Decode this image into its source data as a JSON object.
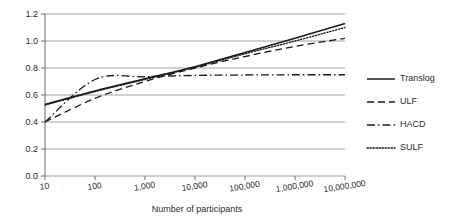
{
  "chart_data": {
    "type": "line",
    "title": "",
    "subtitle": "",
    "xlabel": "Number of participants",
    "ylabel": "",
    "xscale": "log",
    "xlim": [
      10,
      10000000
    ],
    "ylim": [
      0.0,
      1.2
    ],
    "grid": "horizontal",
    "legend_position": "right",
    "xtick_labels": [
      "10",
      "100",
      "1,000",
      "10,000",
      "100,000",
      "1,000,000",
      "10,000,000"
    ],
    "xtick_values": [
      10,
      100,
      1000,
      10000,
      100000,
      1000000,
      10000000
    ],
    "ytick_labels": [
      "0.0",
      "0.2",
      "0.4",
      "0.6",
      "0.8",
      "1.0",
      "1.2"
    ],
    "ytick_values": [
      0.0,
      0.2,
      0.4,
      0.6,
      0.8,
      1.0,
      1.2
    ],
    "x": [
      10,
      100,
      1000,
      10000,
      100000,
      1000000,
      10000000
    ],
    "series": [
      {
        "name": "Translog",
        "style": "solid",
        "color": "#1a1a1a",
        "values": [
          0.53,
          0.63,
          0.72,
          0.81,
          0.915,
          1.02,
          1.13
        ]
      },
      {
        "name": "ULF",
        "style": "dashed",
        "color": "#1a1a1a",
        "values": [
          0.4,
          0.575,
          0.7,
          0.8,
          0.885,
          0.96,
          1.02
        ]
      },
      {
        "name": "HACD",
        "style": "dashdot",
        "color": "#1a1a1a",
        "values": [
          0.4,
          0.715,
          0.735,
          0.745,
          0.748,
          0.75,
          0.75
        ]
      },
      {
        "name": "SULF",
        "style": "dotted",
        "color": "#1a1a1a",
        "values": [
          0.525,
          0.625,
          0.715,
          0.805,
          0.905,
          1.0,
          1.1
        ]
      }
    ]
  },
  "legend": {
    "items": [
      {
        "label": "Translog"
      },
      {
        "label": "ULF"
      },
      {
        "label": "HACD"
      },
      {
        "label": "SULF"
      }
    ]
  }
}
